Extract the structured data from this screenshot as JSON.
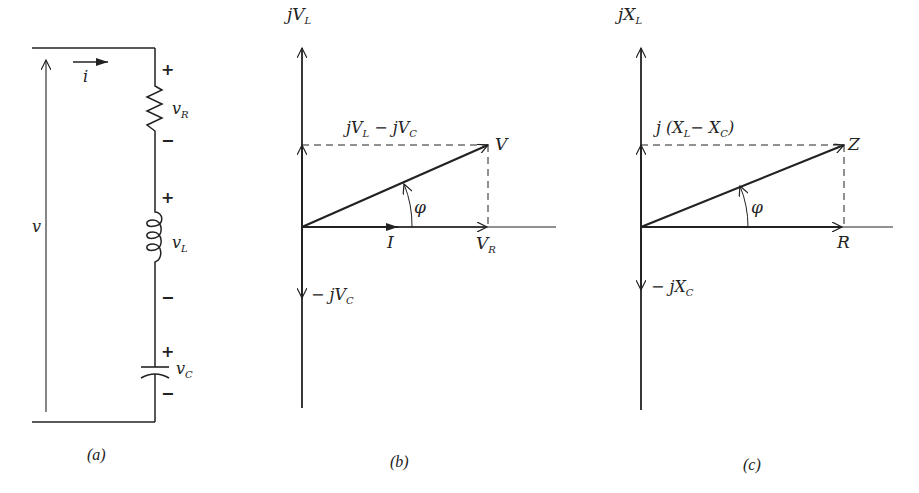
{
  "figure": {
    "panels": [
      {
        "id": "a",
        "caption": "(a)",
        "type": "series RLC circuit",
        "labels": {
          "source_voltage": "v",
          "current": "i",
          "resistor_voltage": "v",
          "resistor_sub": "R",
          "inductor_voltage": "v",
          "inductor_sub": "L",
          "capacitor_voltage": "v",
          "capacitor_sub": "C",
          "plus": "+",
          "minus": "−"
        }
      },
      {
        "id": "b",
        "caption": "(b)",
        "type": "voltage phasor diagram",
        "labels": {
          "top_axis": "jV",
          "top_axis_sub": "L",
          "diff_label_1": "jV",
          "diff_sub_1": "L",
          "diff_minus": " − jV",
          "diff_sub_2": "C",
          "resultant": "V",
          "angle": "φ",
          "current": "I",
          "real": "V",
          "real_sub": "R",
          "neg_axis": "− jV",
          "neg_axis_sub": "C"
        }
      },
      {
        "id": "c",
        "caption": "(c)",
        "type": "impedance diagram",
        "labels": {
          "top_axis": "jX",
          "top_axis_sub": "L",
          "diff_label_1": "j (X",
          "diff_sub_1": "L",
          "diff_minus": "− X",
          "diff_sub_2": "C",
          "diff_close": ")",
          "resultant": "Z",
          "angle": "φ",
          "real": "R",
          "neg_axis": "− jX",
          "neg_axis_sub": "C"
        }
      }
    ]
  }
}
